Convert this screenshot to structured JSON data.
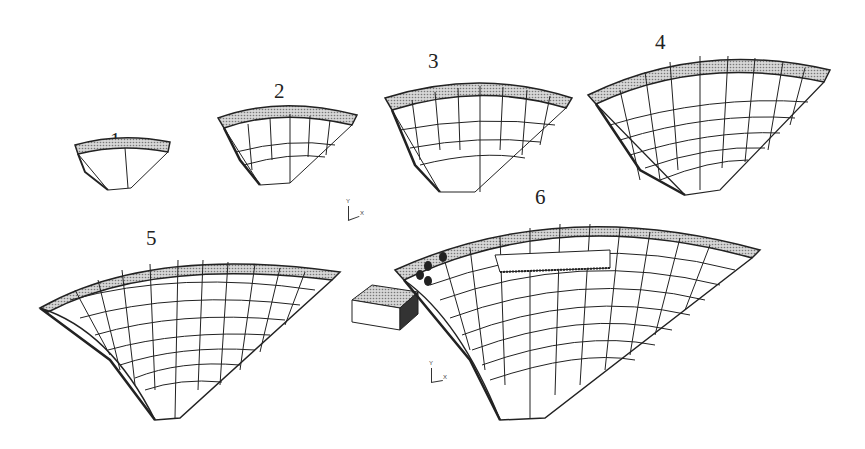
{
  "figure": {
    "stages": [
      {
        "label": "1"
      },
      {
        "label": "2"
      },
      {
        "label": "3"
      },
      {
        "label": "4"
      },
      {
        "label": "5"
      },
      {
        "label": "6"
      }
    ],
    "axis_triads": [
      {
        "y_label": "Y",
        "x_label": "X"
      },
      {
        "y_label": "Y",
        "x_label": "X"
      }
    ],
    "colors": {
      "line": "#222222",
      "hatch": "#9a9a9a",
      "background": "#ffffff"
    }
  }
}
